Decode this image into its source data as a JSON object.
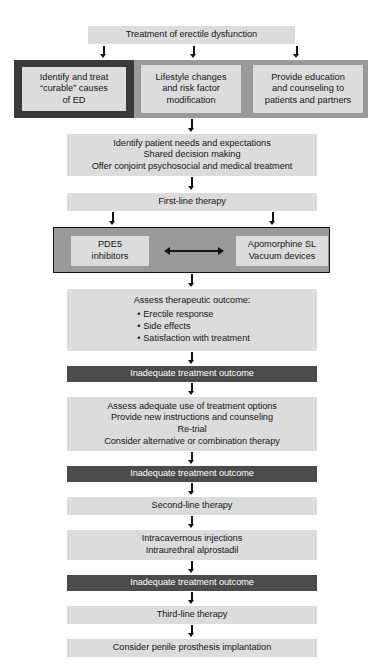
{
  "title": "Treatment of erectile dysfunction",
  "colors": {
    "light_box": "#dcdcdc",
    "dark_box": "#4b4b4b",
    "band_gray": "#9a9a9a",
    "band_dark_cell": "#3a3a3a",
    "arrow": "#141414",
    "text": "#16181a",
    "dark_text": "#ffffff",
    "page_background": "#ffffff"
  },
  "nodes": {
    "title_box": {
      "label": "Treatment of erectile dysfunction"
    },
    "first_band": {
      "cells": [
        {
          "lines": [
            "Identify and treat",
            "“curable” causes",
            "of ED"
          ],
          "emphasis": "dark-border"
        },
        {
          "lines": [
            "Lifestyle changes",
            "and risk factor",
            "modification"
          ],
          "emphasis": "gray-border"
        },
        {
          "lines": [
            "Provide education",
            "and counseling to",
            "patients and partners"
          ],
          "emphasis": "gray-border"
        }
      ]
    },
    "needs_box": {
      "lines": [
        "Identify patient needs and expectations",
        "Shared decision making",
        "Offer conjoint psychosocial and medical treatment"
      ]
    },
    "first_line": {
      "label": "First-line therapy"
    },
    "therapy_band": {
      "left": {
        "lines": [
          "PDE5",
          "inhibitors"
        ]
      },
      "right": {
        "lines": [
          "Apomorphine SL",
          "Vacuum devices"
        ]
      },
      "connector": "double-headed-arrow"
    },
    "assess_outcome": {
      "heading": "Assess therapeutic outcome:",
      "bullets": [
        "Erectile response",
        "Side effects",
        "Satisfaction with treatment"
      ]
    },
    "inadequate_1": {
      "label": "Inadequate treatment outcome"
    },
    "reassess_box": {
      "lines": [
        "Assess adequate use of treatment options",
        "Provide new instructions and counseling",
        "Re-trial",
        "Consider alternative or combination therapy"
      ]
    },
    "inadequate_2": {
      "label": "Inadequate treatment outcome"
    },
    "second_line": {
      "label": "Second-line therapy"
    },
    "injections_box": {
      "lines": [
        "Intracavernous injections",
        "Intraurethral alprostadil"
      ]
    },
    "inadequate_3": {
      "label": "Inadequate treatment outcome"
    },
    "third_line": {
      "label": "Third-line therapy"
    },
    "prosthesis_box": {
      "label": "Consider penile prosthesis implantation"
    }
  }
}
